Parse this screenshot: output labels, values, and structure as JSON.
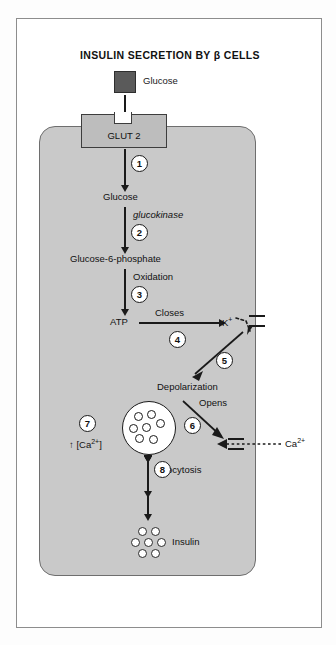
{
  "figure": {
    "title": "INSULIN SECRETION BY β CELLS"
  },
  "extracellular": {
    "glucose_label": "Glucose",
    "calcium_label": "Ca2+",
    "insulin_label": "Insulin"
  },
  "membrane": {
    "transporter_label": "GLUT 2"
  },
  "pathway": {
    "nodes": [
      {
        "id": "glucose-intracellular",
        "label": "Glucose"
      },
      {
        "id": "glucose-6-phosphate",
        "label": "Glucose-6-phosphate"
      },
      {
        "id": "atp",
        "label": "ATP"
      },
      {
        "id": "potassium",
        "label": "K+"
      },
      {
        "id": "depolarization",
        "label": "Depolarization"
      },
      {
        "id": "calcium-rise",
        "label": "[Ca2+]"
      }
    ],
    "edge_labels": {
      "enzyme": "glucokinase",
      "oxidation": "Oxidation",
      "closes": "Closes",
      "opens": "Opens",
      "exocytosis": "Exocytosis"
    }
  },
  "steps": [
    {
      "number": "1"
    },
    {
      "number": "2"
    },
    {
      "number": "3"
    },
    {
      "number": "4"
    },
    {
      "number": "5"
    },
    {
      "number": "6"
    },
    {
      "number": "7"
    },
    {
      "number": "8"
    }
  ],
  "colors": {
    "cell_fill": "#c9c9c9",
    "cell_stroke": "#6e6e6e",
    "glucose_chip": "#5a5a5a",
    "transporter_fill": "#bdbdbd",
    "stroke": "#1a1a1a",
    "frame": "#8d8d8d"
  }
}
